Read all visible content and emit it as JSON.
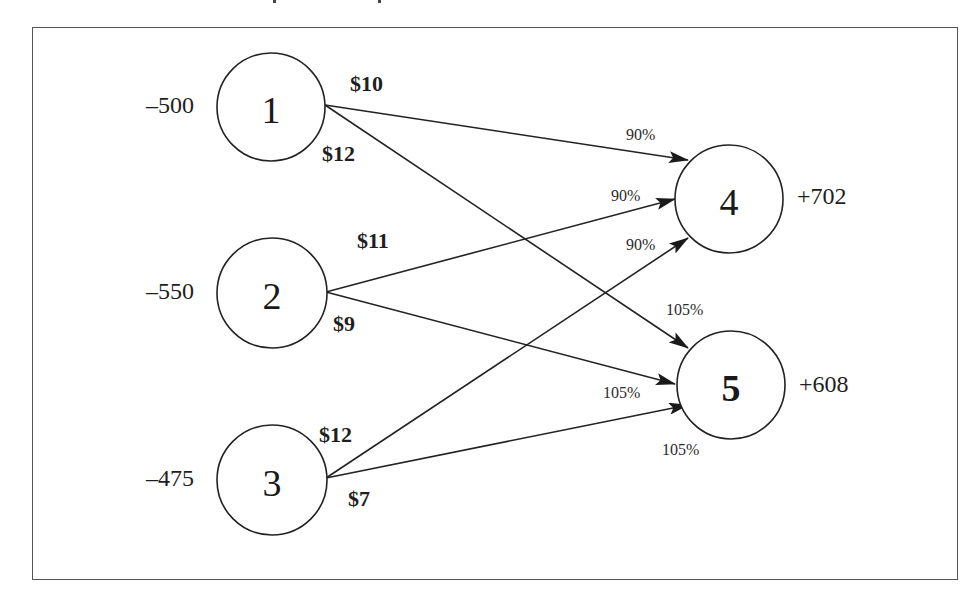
{
  "diagram": {
    "type": "network-flow",
    "nodes": [
      {
        "id": "1",
        "label": "1",
        "balance": "–500",
        "side": "source"
      },
      {
        "id": "2",
        "label": "2",
        "balance": "–550",
        "side": "source"
      },
      {
        "id": "3",
        "label": "3",
        "balance": "–475",
        "side": "source"
      },
      {
        "id": "4",
        "label": "4",
        "balance": "+702",
        "side": "sink"
      },
      {
        "id": "5",
        "label": "5",
        "balance": "+608",
        "side": "sink"
      }
    ],
    "edges": [
      {
        "from": "1",
        "to": "4",
        "cost": "$10",
        "multiplier": "90%"
      },
      {
        "from": "1",
        "to": "5",
        "cost": "$12",
        "multiplier": "105%"
      },
      {
        "from": "2",
        "to": "4",
        "cost": "$11",
        "multiplier": "90%"
      },
      {
        "from": "2",
        "to": "5",
        "cost": "$9",
        "multiplier": "105%"
      },
      {
        "from": "3",
        "to": "4",
        "cost": "$12",
        "multiplier": "90%"
      },
      {
        "from": "3",
        "to": "5",
        "cost": "$7",
        "multiplier": "105%"
      }
    ],
    "colors": {
      "stroke": "#222222",
      "frame": "#555555",
      "background": "#ffffff"
    }
  }
}
